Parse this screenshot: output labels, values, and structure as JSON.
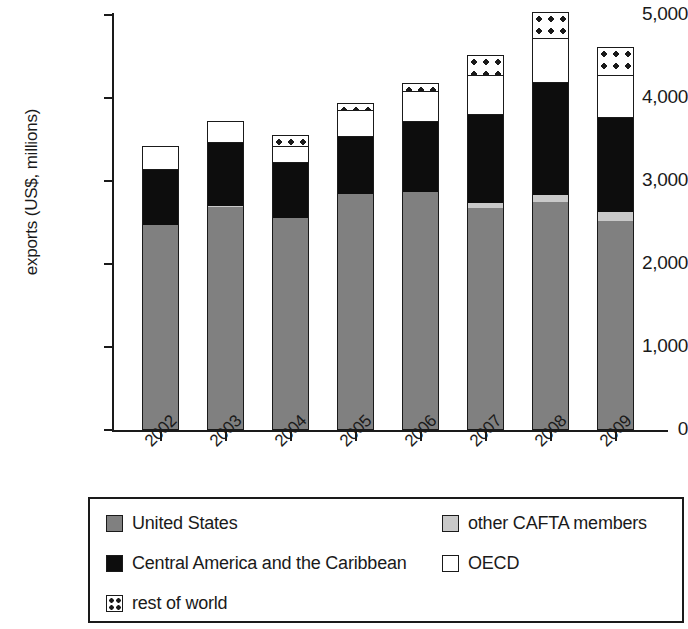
{
  "chart_data": {
    "type": "bar",
    "subtype": "stacked",
    "title": "",
    "xlabel": "",
    "ylabel": "exports (US$, millions)",
    "ylim": [
      0,
      5000
    ],
    "ytick_labels": [
      "5,000",
      "4,000",
      "3,000",
      "2,000",
      "1,000",
      "0"
    ],
    "ytick_values": [
      5000,
      4000,
      3000,
      2000,
      1000,
      0
    ],
    "grid": false,
    "legend_position": "bottom",
    "categories": [
      "2002",
      "2003",
      "2004",
      "2005",
      "2006",
      "2007",
      "2008",
      "2009"
    ],
    "series": [
      {
        "name": "United States",
        "color": "#808080",
        "values": [
          2470,
          2690,
          2555,
          2845,
          2870,
          2670,
          2750,
          2520
        ]
      },
      {
        "name": "other CAFTA members",
        "color": "#c9c9c9",
        "values": [
          0,
          10,
          0,
          0,
          0,
          65,
          80,
          110
        ]
      },
      {
        "name": "Central America and the Caribbean",
        "color": "#0d0d0d",
        "values": [
          665,
          760,
          660,
          690,
          840,
          1060,
          1350,
          1130
        ]
      },
      {
        "name": "OECD",
        "color": "#ffffff",
        "values": [
          285,
          265,
          205,
          325,
          375,
          480,
          545,
          520
        ]
      },
      {
        "name": "rest of world",
        "color": "#ffffff",
        "pattern": "dotted",
        "values": [
          0,
          0,
          135,
          85,
          95,
          240,
          310,
          340
        ]
      }
    ],
    "totals": [
      3420,
      3725,
      3555,
      3945,
      4180,
      4515,
      5035,
      4620
    ]
  },
  "axis": {
    "y_title": "exports (US$, millions)",
    "y_ticks": [
      {
        "label": "5,000",
        "value": 5000
      },
      {
        "label": "4,000",
        "value": 4000
      },
      {
        "label": "3,000",
        "value": 3000
      },
      {
        "label": "2,000",
        "value": 2000
      },
      {
        "label": "1,000",
        "value": 1000
      },
      {
        "label": "0",
        "value": 0
      }
    ],
    "x_ticks": [
      "2002",
      "2003",
      "2004",
      "2005",
      "2006",
      "2007",
      "2008",
      "2009"
    ]
  },
  "legend": {
    "items": [
      {
        "label": "United States",
        "swatch": "us"
      },
      {
        "label": "other CAFTA members",
        "swatch": "cafta"
      },
      {
        "label": "Central America and the Caribbean",
        "swatch": "ca"
      },
      {
        "label": "OECD",
        "swatch": "oecd"
      },
      {
        "label": "rest of world",
        "swatch": "row"
      }
    ]
  }
}
